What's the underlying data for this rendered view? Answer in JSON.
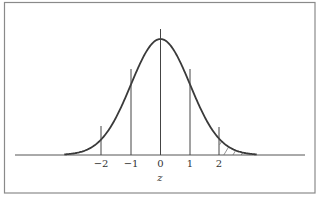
{
  "chart_data": {
    "type": "line",
    "title": "",
    "xlabel": "z",
    "ylabel": "",
    "xlim": [
      -3.2,
      3.2
    ],
    "ylim": [
      0,
      0.42
    ],
    "grid": false,
    "legend": null,
    "tick_labels": [
      "−2",
      "−1",
      "0",
      "1",
      "2"
    ],
    "tick_values": [
      -2,
      -1,
      0,
      1,
      2
    ],
    "series": [
      {
        "name": "standard normal pdf",
        "x": [
          -3,
          -2.5,
          -2,
          -1.5,
          -1,
          -0.5,
          0,
          0.5,
          1,
          1.5,
          2,
          2.5,
          3
        ],
        "values": [
          0.0044,
          0.0175,
          0.054,
          0.1295,
          0.242,
          0.3521,
          0.3989,
          0.3521,
          0.242,
          0.1295,
          0.054,
          0.0175,
          0.0044
        ]
      }
    ],
    "reference_lines": [
      {
        "z": -2,
        "label": "−2"
      },
      {
        "z": -1,
        "label": "−1"
      },
      {
        "z": 0,
        "label": "0"
      },
      {
        "z": 1,
        "label": "1"
      },
      {
        "z": 2,
        "label": "2"
      }
    ],
    "shaded_region": {
      "from": 2,
      "to": 3,
      "style": "hatched",
      "meaning": "upper tail area beyond z = 2"
    }
  },
  "labels": {
    "axis": "z",
    "ticks": [
      "−2",
      "−1",
      "0",
      "1",
      "2"
    ]
  },
  "colors": {
    "frame": "#8a8a8a",
    "curve": "#3a3a3a",
    "lines": "#444444"
  }
}
